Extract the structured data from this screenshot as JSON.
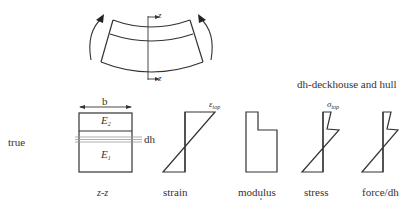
{
  "diagram": {
    "caption_right": "dh-deckhouse and hull",
    "row_label": "true",
    "beam": {
      "axis_top_label": "z",
      "axis_bottom_label": "z"
    },
    "section": {
      "width_label": "b",
      "upper_layer_label": "E",
      "upper_layer_sub": "2",
      "lower_layer_label": "E",
      "lower_layer_sub": "1",
      "strip_label": "dh",
      "caption": "z-z"
    },
    "panels": [
      {
        "id": "strain",
        "caption": "strain",
        "peak_symbol": "ε",
        "peak_sub": "top"
      },
      {
        "id": "modulus",
        "caption": "modulus"
      },
      {
        "id": "stress",
        "caption": "stress",
        "peak_symbol": "σ",
        "peak_sub": "top"
      },
      {
        "id": "force",
        "caption": "force/dh"
      }
    ],
    "colors": {
      "line": "#333333",
      "dh_line": "#9a9a9a"
    }
  }
}
